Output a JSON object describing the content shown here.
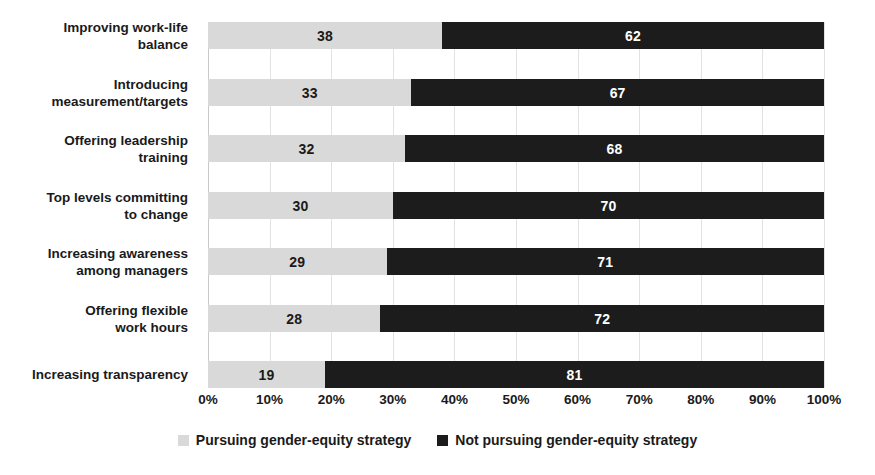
{
  "chart_data": {
    "type": "bar",
    "orientation": "horizontal",
    "stacked": true,
    "normalized_percent": true,
    "title": "",
    "subtitle": "",
    "xlabel": "",
    "ylabel": "",
    "xlim": [
      0,
      100
    ],
    "grid": true,
    "legend_position": "bottom",
    "categories": [
      "Improving work-life balance",
      "Introducing measurement/targets",
      "Offering leadership training",
      "Top levels committing to change",
      "Increasing awareness among managers",
      "Offering flexible work hours",
      "Increasing transparency"
    ],
    "category_lines": [
      [
        "Improving work-life",
        "balance"
      ],
      [
        "Introducing",
        "measurement/targets"
      ],
      [
        "Offering leadership",
        "training"
      ],
      [
        "Top levels committing",
        "to change"
      ],
      [
        "Increasing awareness",
        "among managers"
      ],
      [
        "Offering flexible",
        "work hours"
      ],
      [
        "Increasing transparency"
      ]
    ],
    "series": [
      {
        "name": "Pursuing gender-equity strategy",
        "color": "#d9d9d9",
        "label_color": "#1a1a1a",
        "values": [
          38,
          33,
          32,
          30,
          29,
          28,
          19
        ]
      },
      {
        "name": "Not pursuing gender-equity strategy",
        "color": "#1c1c1c",
        "label_color": "#ffffff",
        "values": [
          62,
          67,
          68,
          70,
          71,
          72,
          81
        ]
      }
    ],
    "x_ticks": [
      0,
      10,
      20,
      30,
      40,
      50,
      60,
      70,
      80,
      90,
      100
    ],
    "x_tick_labels": [
      "0%",
      "10%",
      "20%",
      "30%",
      "40%",
      "50%",
      "60%",
      "70%",
      "80%",
      "90%",
      "100%"
    ]
  },
  "legend": {
    "items": [
      {
        "label": "Pursuing gender-equity strategy",
        "swatch": "light"
      },
      {
        "label": "Not pursuing gender-equity strategy",
        "swatch": "dark"
      }
    ]
  },
  "colors": {
    "light_series": "#d9d9d9",
    "dark_series": "#1c1c1c",
    "gridline": "#e2e2e2",
    "text": "#1a1a1a",
    "background": "#ffffff"
  }
}
